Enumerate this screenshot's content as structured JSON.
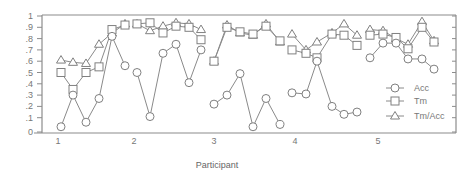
{
  "chart_data": {
    "type": "line",
    "title": "",
    "xlabel": "Participant",
    "ylabel": "",
    "ylim": [
      0,
      1
    ],
    "y_ticks": [
      "0",
      ".1",
      ".2",
      ".3",
      ".4",
      ".5",
      ".6",
      ".7",
      ".8",
      ".9",
      "1"
    ],
    "x_tick_labels": [
      "1",
      "2",
      "3",
      "4",
      "5"
    ],
    "grid": false,
    "legend_position": "lower right (inside)",
    "groups": [
      {
        "participant": "1",
        "x": [
          61,
          73,
          86,
          99,
          112,
          125
        ]
      },
      {
        "participant": "2",
        "x": [
          137,
          150,
          163,
          176,
          189,
          201
        ]
      },
      {
        "participant": "3",
        "x": [
          214,
          227,
          240,
          253,
          266,
          280
        ]
      },
      {
        "participant": "4",
        "x": [
          292,
          306,
          317,
          332,
          344,
          357
        ]
      },
      {
        "participant": "5",
        "x": [
          370,
          383,
          396,
          408,
          422,
          434
        ]
      }
    ],
    "series": [
      {
        "name": "Acc",
        "marker": "circle",
        "values": [
          [
            0.02,
            0.3,
            0.06,
            0.27,
            0.82,
            0.56
          ],
          [
            0.5,
            0.11,
            0.67,
            0.75,
            0.41,
            0.7
          ],
          [
            0.22,
            0.3,
            0.49,
            0.02,
            0.27,
            0.04
          ],
          [
            0.32,
            0.31,
            0.6,
            0.2,
            0.13,
            0.15
          ],
          [
            0.63,
            0.76,
            0.76,
            0.62,
            0.62,
            0.53
          ]
        ]
      },
      {
        "name": "Tm",
        "marker": "square",
        "values": [
          [
            0.5,
            0.35,
            0.5,
            0.55,
            0.88,
            0.92
          ],
          [
            0.93,
            0.94,
            0.85,
            0.91,
            0.9,
            0.79
          ],
          [
            0.6,
            0.9,
            0.86,
            0.84,
            0.91,
            0.78
          ],
          [
            0.7,
            0.67,
            0.63,
            0.84,
            0.83,
            0.74
          ],
          [
            0.83,
            0.84,
            0.81,
            0.71,
            0.9,
            0.77
          ]
        ]
      },
      {
        "name": "Tm/Acc",
        "marker": "triangle",
        "values": [
          [
            0.61,
            0.59,
            0.58,
            0.75,
            0.85,
            0.93
          ],
          [
            0.93,
            0.87,
            0.91,
            0.94,
            0.93,
            0.88
          ],
          [
            0.6,
            0.92,
            0.85,
            0.83,
            0.93,
            0.77
          ],
          [
            0.84,
            0.7,
            0.77,
            0.85,
            0.93,
            0.83
          ],
          [
            0.88,
            0.87,
            0.8,
            0.75,
            0.95,
            0.78
          ]
        ]
      }
    ]
  },
  "legend": {
    "items": [
      {
        "label": "Acc",
        "marker": "circle"
      },
      {
        "label": "Tm",
        "marker": "square"
      },
      {
        "label": "Tm/Acc",
        "marker": "triangle"
      }
    ]
  },
  "axis": {
    "x_title": "Participant"
  },
  "colors": {
    "line": "#8a8a8a",
    "marker_stroke": "#808080",
    "axis": "#8c8c8c",
    "text": "#777777"
  }
}
